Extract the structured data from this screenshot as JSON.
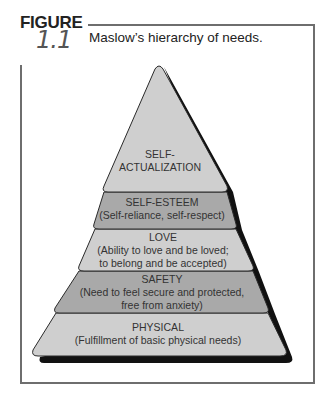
{
  "figure": {
    "label": "FIGURE",
    "number": "1.1",
    "caption": "Maslow’s hierarchy of needs."
  },
  "colors": {
    "light_fill": "#cfcfcf",
    "dark_fill": "#a9a9a9",
    "shadow": "#111111",
    "outline": "#2a2a2a",
    "frame": "#6e6e6e"
  },
  "pyramid": {
    "tiers": [
      {
        "title": "SELF-",
        "title2": "ACTUALIZATION",
        "desc": "",
        "desc2": ""
      },
      {
        "title": "SELF-ESTEEM",
        "desc": "(Self-reliance, self-respect)"
      },
      {
        "title": "LOVE",
        "desc": "(Ability to love and be loved;",
        "desc2": "to belong and be accepted)"
      },
      {
        "title": "SAFETY",
        "desc": "(Need to feel secure and protected,",
        "desc2": "free from anxiety)"
      },
      {
        "title": "PHYSICAL",
        "desc": "(Fulfillment of basic physical needs)"
      }
    ]
  }
}
